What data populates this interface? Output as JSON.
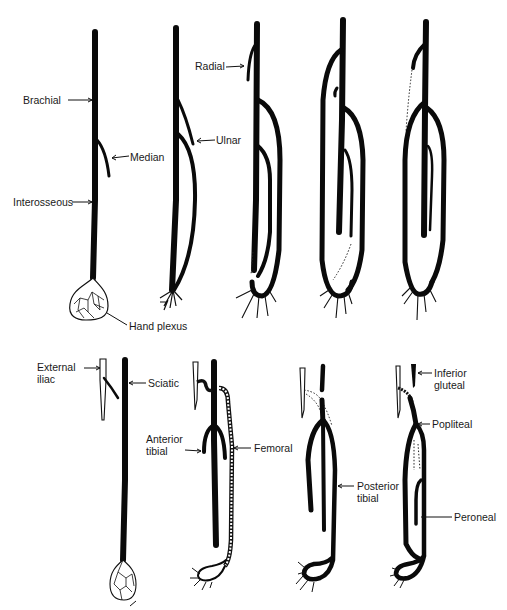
{
  "diagram": {
    "type": "arterial-development-schematic",
    "upper_row": {
      "description": "Development of the arteries of the upper limb (5 stages)",
      "stages": 5,
      "labels": {
        "brachial": "Brachial",
        "median": "Median",
        "interosseous": "Interosseous",
        "hand_plexus": "Hand plexus",
        "ulnar": "Ulnar",
        "radial": "Radial"
      }
    },
    "lower_row": {
      "description": "Development of the arteries of the lower limb (4 stages)",
      "stages": 4,
      "labels": {
        "external_iliac_1": "External",
        "external_iliac_2": "iliac",
        "sciatic": "Sciatic",
        "anterior_tibial_1": "Anterior",
        "anterior_tibial_2": "tibial",
        "femoral": "Femoral",
        "posterior_tibial_1": "Posterior",
        "posterior_tibial_2": "tibial",
        "inferior_gluteal_1": "Inferior",
        "inferior_gluteal_2": "gluteal",
        "popliteal": "Popliteal",
        "peroneal": "Peroneal"
      }
    },
    "colors": {
      "ink": "#0a0a0a",
      "background": "#ffffff"
    }
  }
}
